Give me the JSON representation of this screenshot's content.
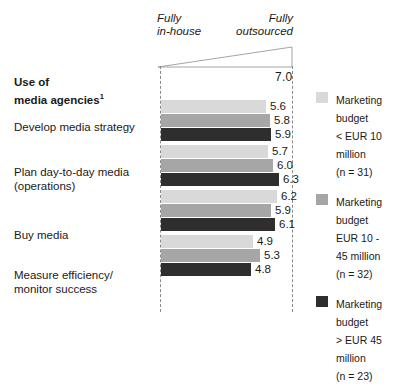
{
  "scale": {
    "left_caption": "Fully\nin-house",
    "right_caption": "Fully\noutsourced",
    "max_value_label": "7.0"
  },
  "heading": {
    "text": "Use of\nmedia agencies",
    "footnote_marker": "1"
  },
  "legend": {
    "items": [
      {
        "swatch_color": "#d9d9d9",
        "text": "Marketing\nbudget\n< EUR 10\nmillion\n(n = 31)"
      },
      {
        "swatch_color": "#a6a6a6",
        "text": "Marketing\nbudget\nEUR 10 -\n45 million\n(n = 32)"
      },
      {
        "swatch_color": "#2e2e2e",
        "text": "Marketing\nbudget\n> EUR 45\nmillion\n(n = 23)"
      }
    ]
  },
  "chart_data": {
    "type": "bar",
    "title": "Use of media agencies",
    "xlabel": "",
    "ylabel": "",
    "xlim": [
      0,
      7.0
    ],
    "grid": false,
    "orientation": "horizontal",
    "legend_position": "right",
    "axis_annotations": {
      "left": "Fully in-house",
      "right": "Fully outsourced",
      "max_tick": "7.0"
    },
    "categories": [
      "Develop media strategy",
      "Plan day-to-day media (operations)",
      "Buy media",
      "Measure efficiency/ monitor success"
    ],
    "series": [
      {
        "name": "Marketing budget < EUR 10 million (n = 31)",
        "color": "#d9d9d9",
        "values": [
          5.6,
          5.7,
          6.2,
          4.9
        ]
      },
      {
        "name": "Marketing budget EUR 10 - 45 million (n = 32)",
        "color": "#a6a6a6",
        "values": [
          5.8,
          6.0,
          5.9,
          5.3
        ]
      },
      {
        "name": "Marketing budget > EUR 45 million (n = 23)",
        "color": "#2e2e2e",
        "values": [
          5.9,
          6.3,
          6.1,
          4.8
        ]
      }
    ],
    "value_labels": [
      [
        "5.6",
        "5.8",
        "5.9"
      ],
      [
        "5.7",
        "6.0",
        "6.3"
      ],
      [
        "6.2",
        "5.9",
        "6.1"
      ],
      [
        "4.9",
        "5.3",
        "4.8"
      ]
    ],
    "group_labels": [
      "Develop media strategy",
      "Plan day-to-day media\n(operations)",
      "Buy media",
      "Measure efficiency/\nmonitor success"
    ]
  }
}
